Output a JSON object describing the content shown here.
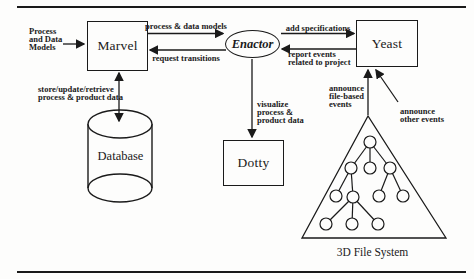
{
  "diagram": {
    "nodes": {
      "marvel": "Marvel",
      "enactor": "Enactor",
      "yeast": "Yeast",
      "database": "Database",
      "dotty": "Dotty",
      "file_system": "3D File System"
    },
    "edge_labels": {
      "input_models": "Process\nand Data\nModels",
      "process_data_models": "process & data models",
      "request_transitions": "request transitions",
      "add_specifications": "add specifications",
      "report_events": "report events\nrelated to project",
      "store_update_retrieve": "store/update/retrieve\nprocess & product data",
      "visualize": "visualize\nprocess &\nproduct data",
      "announce_file_based": "announce\nfile-based\nevents",
      "announce_other": "announce\nother events"
    },
    "colors": {
      "ink": "#1a1a1a",
      "background": "#fdfdfc"
    }
  }
}
